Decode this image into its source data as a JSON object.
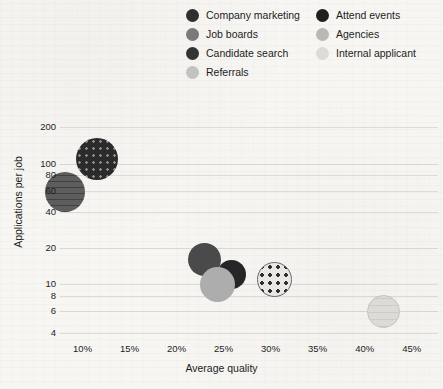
{
  "chart_data": {
    "type": "scatter",
    "title": "",
    "xlabel": "Average quality",
    "ylabel": "Applications per job",
    "xlim": [
      7.6,
      47.8
    ],
    "ylim": [
      3.6,
      230
    ],
    "yscale": "log",
    "xscale": "linear",
    "grid": "horizontal",
    "legend_position": "top",
    "xticks": [
      "10%",
      "15%",
      "20%",
      "25%",
      "30%",
      "35%",
      "40%",
      "45%"
    ],
    "xtick_values": [
      10,
      15,
      20,
      25,
      30,
      35,
      40,
      45
    ],
    "yticks": [
      "200",
      "100",
      "80",
      "60",
      "40",
      "20",
      "10",
      "8",
      "6",
      "4"
    ],
    "ytick_values": [
      200,
      100,
      80,
      60,
      40,
      20,
      10,
      8,
      6,
      4
    ],
    "points": [
      {
        "name": "Candidate search",
        "x": 11.5,
        "y": 110,
        "size": 42,
        "style": "fill-dark-dot",
        "swatch": "#2b2b2b"
      },
      {
        "name": "Company marketing",
        "x": 8.1,
        "y": 58,
        "size": 40,
        "style": "fill-gray-stripe",
        "swatch": "#3a3a3a"
      },
      {
        "name": "Job boards",
        "x": 23.0,
        "y": 16,
        "size": 33,
        "style": "fill-med-gray",
        "swatch": "#6d6d6d"
      },
      {
        "name": "Attend events",
        "x": 25.8,
        "y": 12,
        "size": 29,
        "style": "fill-black",
        "swatch": "#1f1f1f"
      },
      {
        "name": "Referrals",
        "x": 24.3,
        "y": 10,
        "size": 35,
        "style": "fill-light-gray",
        "swatch": "#b5b5b5"
      },
      {
        "name": "Agencies",
        "x": 30.4,
        "y": 11,
        "size": 35,
        "style": "fill-light-dot",
        "swatch": "#c9c8c4"
      },
      {
        "name": "Internal applicant",
        "x": 42.0,
        "y": 6,
        "size": 33,
        "style": "fill-very-light",
        "swatch": "#deddd8"
      }
    ]
  },
  "legend": {
    "left_column": [
      {
        "label": "Company marketing",
        "swatch": "#2f2f2f"
      },
      {
        "label": "Job boards",
        "swatch": "#7a7a7a"
      },
      {
        "label": "Candidate search",
        "swatch": "#333333"
      },
      {
        "label": "Referrals",
        "swatch": "#c2c2c2"
      }
    ],
    "right_column": [
      {
        "label": "Attend events",
        "swatch": "#1f1f1f"
      },
      {
        "label": "Agencies",
        "swatch": "#b9b8b4"
      },
      {
        "label": "Internal applicant",
        "swatch": "#dcdbd7"
      }
    ]
  }
}
